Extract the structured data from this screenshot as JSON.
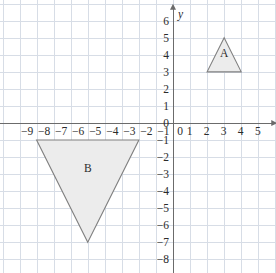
{
  "figure": {
    "type": "coordinate-plane",
    "background_color": "#ffffff",
    "grid_color": "#d7dde6",
    "axis_color": "#6b6b6b",
    "shape_fill": "#ececec",
    "shape_stroke": "#808080"
  },
  "axes": {
    "x": {
      "name": "x",
      "min": -9,
      "max": 5,
      "tick_labels": [
        "−9",
        "−8",
        "−7",
        "−6",
        "−5",
        "−4",
        "−3",
        "−2",
        "−1",
        "0",
        "1",
        "2",
        "3",
        "4",
        "5"
      ],
      "tick_values": [
        -9,
        -8,
        -7,
        -6,
        -5,
        -4,
        -3,
        -2,
        -1,
        0,
        1,
        2,
        3,
        4,
        5
      ]
    },
    "y": {
      "name": "y",
      "min": -8,
      "max": 6,
      "tick_labels": [
        "6",
        "5",
        "4",
        "3",
        "2",
        "1",
        "0",
        "−1",
        "−2",
        "−3",
        "−4",
        "−5",
        "−6",
        "−7",
        "−8"
      ],
      "tick_values": [
        6,
        5,
        4,
        3,
        2,
        1,
        0,
        -1,
        -2,
        -3,
        -4,
        -5,
        -6,
        -7,
        -8
      ]
    }
  },
  "chart_data": {
    "type": "scatter",
    "title": "",
    "xlabel": "x",
    "ylabel": "y",
    "xlim": [
      -9,
      5
    ],
    "ylim": [
      -8,
      6
    ],
    "grid": true,
    "legend": "none",
    "shapes": [
      {
        "label": "A",
        "kind": "triangle",
        "vertices": [
          [
            2,
            3
          ],
          [
            4,
            3
          ],
          [
            3,
            5
          ]
        ],
        "label_position": [
          3,
          3.85
        ],
        "fill": "#ececec",
        "stroke": "#808080"
      },
      {
        "label": "B",
        "kind": "triangle",
        "vertices": [
          [
            -8,
            -1
          ],
          [
            -2,
            -1
          ],
          [
            -5,
            -7
          ]
        ],
        "label_position": [
          -5,
          -2.85
        ],
        "fill": "#ececec",
        "stroke": "#808080"
      }
    ]
  }
}
